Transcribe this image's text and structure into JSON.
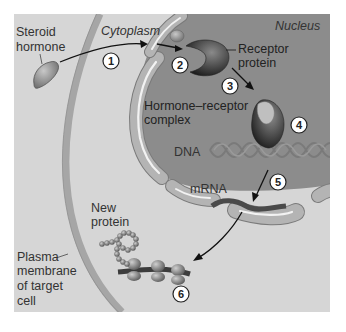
{
  "diagram": {
    "labels": {
      "steroid_hormone_line1": "Steroid",
      "steroid_hormone_line2": "hormone",
      "cytoplasm": "Cytoplasm",
      "nucleus": "Nucleus",
      "receptor_line1": "Receptor",
      "receptor_line2": "protein",
      "complex_line1": "Hormone–receptor",
      "complex_line2": "complex",
      "dna": "DNA",
      "mrna": "mRNA",
      "new_protein_line1": "New",
      "new_protein_line2": "protein",
      "plasma_line1": "Plasma",
      "plasma_line2": "membrane",
      "plasma_line3": "of target",
      "plasma_line4": "cell"
    },
    "steps": [
      "1",
      "2",
      "3",
      "4",
      "5",
      "6"
    ],
    "colors": {
      "cytoplasm": "#d6d6d6",
      "nucleus": "#8c8c8c",
      "membrane": "#a8a8a8",
      "receptor": "#3c3c3c",
      "hormone": "#9a9a9a",
      "mrna": "#4a4a4a"
    }
  }
}
